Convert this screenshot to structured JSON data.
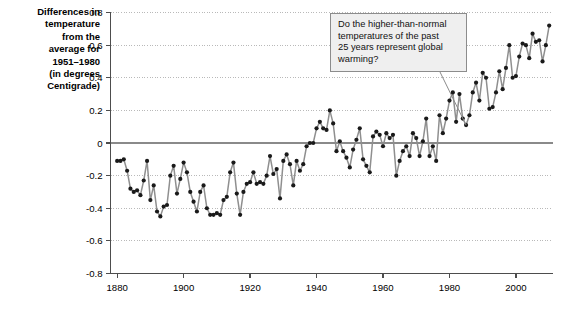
{
  "axis_label": {
    "lines": [
      "Differences in",
      "temperature",
      "from the",
      "average for",
      "1951–1980",
      "(in degrees",
      "Centigrade)"
    ]
  },
  "annotation": {
    "text": "Do the higher-than-normal temperatures of the past 25 years represent global warming?",
    "lines": [
      "Do the higher-than-normal",
      "temperatures of the past",
      "25 years represent global",
      "warming?"
    ]
  },
  "style": {
    "line_color": "#8f8f8f",
    "marker_color": "#1a1a1a",
    "grid_color": "#b9b9b9",
    "axis_color": "#4d4d4d",
    "zero_line_color": "#8a8a8a",
    "box_fill": "#efefef",
    "box_border": "#8c8c8c",
    "background": "#ffffff"
  },
  "chart_data": {
    "type": "line",
    "title": "",
    "subtitle": "",
    "xlabel": "",
    "ylabel": "Differences in temperature from the average for 1951–1980 (in degrees Centigrade)",
    "xlim": [
      1878,
      2011
    ],
    "ylim": [
      -0.8,
      0.8
    ],
    "yticks": [
      -0.8,
      -0.6,
      -0.4,
      -0.2,
      0,
      0.2,
      0.4,
      0.6,
      0.8
    ],
    "ytick_labels": [
      "-0.8",
      "-0.6",
      "-0.4",
      "-0.2",
      "0",
      "0.2",
      "0.4",
      "0.6",
      "0.8"
    ],
    "xticks": [
      1880,
      1900,
      1920,
      1940,
      1960,
      1980,
      2000
    ],
    "xtick_labels": [
      "1880",
      "1900",
      "1920",
      "1940",
      "1960",
      "1980",
      "2000"
    ],
    "grid": true,
    "grid_axis": "y",
    "legend": false,
    "markers": true,
    "zero_reference_line": 0,
    "x": [
      1880,
      1881,
      1882,
      1883,
      1884,
      1885,
      1886,
      1887,
      1888,
      1889,
      1890,
      1891,
      1892,
      1893,
      1894,
      1895,
      1896,
      1897,
      1898,
      1899,
      1900,
      1901,
      1902,
      1903,
      1904,
      1905,
      1906,
      1907,
      1908,
      1909,
      1910,
      1911,
      1912,
      1913,
      1914,
      1915,
      1916,
      1917,
      1918,
      1919,
      1920,
      1921,
      1922,
      1923,
      1924,
      1925,
      1926,
      1927,
      1928,
      1929,
      1930,
      1931,
      1932,
      1933,
      1934,
      1935,
      1936,
      1937,
      1938,
      1939,
      1940,
      1941,
      1942,
      1943,
      1944,
      1945,
      1946,
      1947,
      1948,
      1949,
      1950,
      1951,
      1952,
      1953,
      1954,
      1955,
      1956,
      1957,
      1958,
      1959,
      1960,
      1961,
      1962,
      1963,
      1964,
      1965,
      1966,
      1967,
      1968,
      1969,
      1970,
      1971,
      1972,
      1973,
      1974,
      1975,
      1976,
      1977,
      1978,
      1979,
      1980,
      1981,
      1982,
      1983,
      1984,
      1985,
      1986,
      1987,
      1988,
      1989,
      1990,
      1991,
      1992,
      1993,
      1994,
      1995,
      1996,
      1997,
      1998,
      1999,
      2000,
      2001,
      2002,
      2003,
      2004,
      2005,
      2006,
      2007,
      2008,
      2009,
      2010
    ],
    "values": [
      -0.11,
      -0.11,
      -0.1,
      -0.17,
      -0.28,
      -0.3,
      -0.29,
      -0.32,
      -0.23,
      -0.11,
      -0.35,
      -0.26,
      -0.42,
      -0.45,
      -0.39,
      -0.38,
      -0.2,
      -0.14,
      -0.31,
      -0.22,
      -0.12,
      -0.18,
      -0.3,
      -0.36,
      -0.42,
      -0.3,
      -0.26,
      -0.4,
      -0.44,
      -0.44,
      -0.43,
      -0.44,
      -0.35,
      -0.33,
      -0.18,
      -0.12,
      -0.31,
      -0.44,
      -0.3,
      -0.25,
      -0.24,
      -0.18,
      -0.25,
      -0.24,
      -0.25,
      -0.2,
      -0.08,
      -0.19,
      -0.16,
      -0.34,
      -0.11,
      -0.07,
      -0.13,
      -0.26,
      -0.11,
      -0.17,
      -0.13,
      -0.02,
      0.0,
      0.0,
      0.09,
      0.13,
      0.09,
      0.08,
      0.2,
      0.12,
      -0.05,
      0.01,
      -0.05,
      -0.09,
      -0.15,
      -0.04,
      0.02,
      0.09,
      -0.1,
      -0.14,
      -0.18,
      0.04,
      0.07,
      0.05,
      -0.02,
      0.06,
      0.03,
      0.05,
      -0.2,
      -0.11,
      -0.05,
      -0.02,
      -0.08,
      0.06,
      0.03,
      -0.08,
      0.01,
      0.15,
      -0.08,
      -0.02,
      -0.11,
      0.17,
      0.06,
      0.15,
      0.26,
      0.31,
      0.13,
      0.3,
      0.15,
      0.11,
      0.17,
      0.31,
      0.37,
      0.26,
      0.43,
      0.4,
      0.21,
      0.22,
      0.31,
      0.44,
      0.33,
      0.46,
      0.6,
      0.4,
      0.41,
      0.53,
      0.61,
      0.6,
      0.52,
      0.67,
      0.62,
      0.63,
      0.5,
      0.6,
      0.72
    ],
    "annotations": [
      {
        "text": "Do the higher-than-normal temperatures of the past 25 years represent global warming?",
        "points_to_year": 1985,
        "points_to_value": 0.11
      }
    ]
  }
}
